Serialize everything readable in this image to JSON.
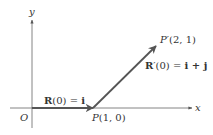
{
  "diagram": {
    "type": "vector-diagram",
    "axes": {
      "x_label": "x",
      "y_label": "y",
      "origin_label": "O"
    },
    "points": {
      "P": {
        "label": "P(1, 0)",
        "x": 1,
        "y": 0
      },
      "P_prime": {
        "label": "P′(2, 1)",
        "x": 2,
        "y": 1
      }
    },
    "vectors": {
      "R0": {
        "label_bold": "R",
        "label_rest": "(0) = ",
        "label_unit": "i",
        "from": [
          0,
          0
        ],
        "to": [
          1,
          0
        ]
      },
      "R_prime0": {
        "label_bold": "R",
        "label_rest": "′(0) = ",
        "label_unit": "i + j",
        "from": [
          1,
          0
        ],
        "to": [
          2,
          1
        ]
      }
    },
    "colors": {
      "axis": "#555555",
      "vector": "#555555",
      "text": "#333333"
    }
  }
}
